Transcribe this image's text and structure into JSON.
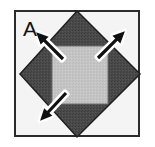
{
  "figure": {
    "panel_label": "A",
    "caption": "",
    "background_color": "#ffffff",
    "border": {
      "color": "#2b2b2b",
      "width": 2,
      "x": 14,
      "y": 10,
      "w": 126,
      "h": 127,
      "fill": "#f4f4f4"
    },
    "shapes": {
      "diamond": {
        "name": "rotated-square-diamond",
        "fill": "#4a4a4a",
        "stroke": "#1f1f1f",
        "stroke_width": 1.5,
        "vertices": "77,11 140,74 77,137 20,74"
      },
      "inner_square": {
        "name": "inner-square",
        "fill": "#c4c4c4",
        "stroke": "#6e6e6e",
        "stroke_width": 1,
        "x": 52,
        "y": 46,
        "w": 56,
        "h": 58
      }
    },
    "arrows": [
      {
        "name": "arrow-up-left",
        "direction": "up-left",
        "fill": "#111111",
        "outline": "#ffffff",
        "tail_x": 63,
        "tail_y": 59,
        "tip_x": 36,
        "tip_y": 32
      },
      {
        "name": "arrow-up-right",
        "direction": "up-right",
        "fill": "#111111",
        "outline": "#ffffff",
        "tail_x": 98,
        "tail_y": 58,
        "tip_x": 124,
        "tip_y": 31
      },
      {
        "name": "arrow-down-left",
        "direction": "down-left",
        "fill": "#111111",
        "outline": "#ffffff",
        "tail_x": 66,
        "tail_y": 93,
        "tip_x": 38,
        "tip_y": 123
      }
    ]
  }
}
